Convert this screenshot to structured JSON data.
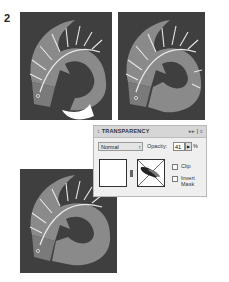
{
  "step_number": "2",
  "artworks": [
    {
      "name": "fish-artwork-1",
      "has_white_mask_shape": true
    },
    {
      "name": "fish-artwork-2",
      "has_white_mask_shape": false
    },
    {
      "name": "fish-artwork-3",
      "has_white_mask_shape": false
    }
  ],
  "panel": {
    "title": "↕ TRANSPARENCY",
    "controls": "▸▸ | ≡",
    "blend_mode": "Normal",
    "blend_arrow": "↕",
    "opacity_label": "Opacity:",
    "opacity_value": "41",
    "opacity_button": "▶",
    "percent": "%",
    "clip_label": "Clip",
    "invert_mask_label": "Invert Mask"
  },
  "colors": {
    "background": "#3f3f3f",
    "fish_body": "#8a8a8a",
    "fish_dark": "#6e6e6e",
    "stripe": "#e8e8e8"
  }
}
